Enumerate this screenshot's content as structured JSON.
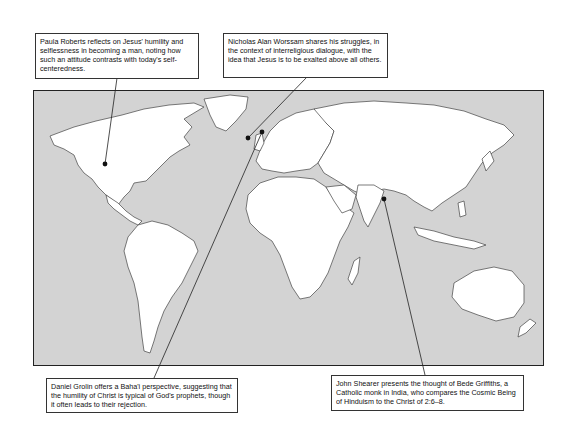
{
  "map": {
    "type": "world-outline-map",
    "ocean_color": "#d3d3d3",
    "land_color": "#ffffff",
    "border_color": "#444444"
  },
  "callouts": [
    {
      "id": "paula-roberts",
      "text": "Paula Roberts reflects on Jesus' humility and selflessness in becoming a man, noting how such an attitude contrasts with today's self-centeredness.",
      "location": "North America (United States)"
    },
    {
      "id": "nicholas-worssam",
      "text": "Nicholas Alan Worssam shares his struggles, in the context of interreligious dialogue, with the idea that Jesus is to be exalted above all others.",
      "location": "Europe (United Kingdom)"
    },
    {
      "id": "daniel-grolin",
      "text": "Daniel Grolin offers a Baha'i perspective, suggesting that the humility of Christ is typical of God's prophets, though it often leads to their rejection.",
      "location": "Europe (Denmark)"
    },
    {
      "id": "john-shearer",
      "text": "John Shearer presents the thought of Bede Griffiths, a Catholic monk in India, who compares the Cosmic Being of Hinduism to the Christ of 2:6–8.",
      "location": "India"
    }
  ]
}
